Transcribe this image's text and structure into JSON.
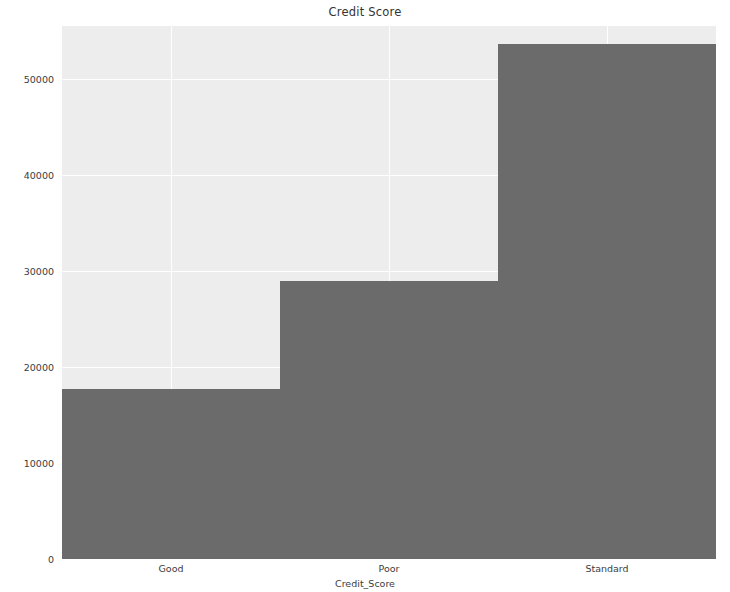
{
  "chart_data": {
    "type": "bar",
    "title": "Credit Score",
    "xlabel": "Credit_Score",
    "ylabel": "Count",
    "categories": [
      "Good",
      "Poor",
      "Standard"
    ],
    "values": [
      17700,
      28950,
      53600
    ],
    "series": [
      {
        "name": "Count",
        "values": [
          17700,
          28950,
          53600
        ]
      }
    ],
    "ylim": [
      0,
      55500
    ],
    "yticks": [
      0,
      10000,
      20000,
      30000,
      40000,
      50000
    ],
    "ytick_labels": [
      "0",
      "10000",
      "20000",
      "30000",
      "40000",
      "50000"
    ],
    "xtick_labels": [
      "Good",
      "Poor",
      "Standard"
    ],
    "grid": true,
    "grid_axis": "both",
    "legend": null,
    "legend_position": "none",
    "bar_color": "#6b6b6b",
    "plot_background": "#ededed",
    "figure_background": "#ffffff",
    "gridline_color": "#ffffff",
    "bar_width_fraction": 1.0
  },
  "axis": {
    "y_ticks": [
      {
        "label": "50000",
        "value": 50000
      },
      {
        "label": "40000",
        "value": 40000
      },
      {
        "label": "30000",
        "value": 30000
      },
      {
        "label": "20000",
        "value": 20000
      },
      {
        "label": "10000",
        "value": 10000
      },
      {
        "label": "0",
        "value": 0
      }
    ],
    "x_ticks": [
      {
        "label": "Good",
        "index": 0
      },
      {
        "label": "Poor",
        "index": 1
      },
      {
        "label": "Standard",
        "index": 2
      }
    ]
  }
}
